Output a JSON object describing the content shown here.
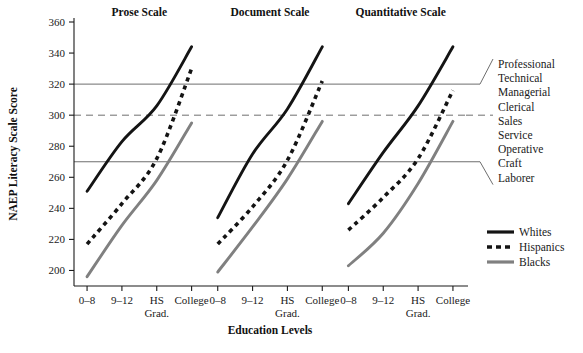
{
  "chart_data": {
    "type": "line",
    "title": "",
    "xlabel": "Education Levels",
    "ylabel": "NAEP Literacy Scale Score",
    "ylim": [
      190,
      360
    ],
    "yticks": [
      200,
      220,
      240,
      260,
      280,
      300,
      320,
      340,
      360
    ],
    "ytick_labels": [
      "200",
      "220",
      "240",
      "260",
      "280",
      "300",
      "320",
      "340",
      "360"
    ],
    "grid": true,
    "gridlines": [
      {
        "value": 320,
        "style": "solid"
      },
      {
        "value": 300,
        "style": "dashed"
      },
      {
        "value": 270,
        "style": "solid"
      }
    ],
    "categories": [
      "0–8",
      "9–12",
      "HS Grad.",
      "College"
    ],
    "category_labels": [
      {
        "line1": "0–8",
        "line2": ""
      },
      {
        "line1": "9–12",
        "line2": ""
      },
      {
        "line1": "HS",
        "line2": "Grad."
      },
      {
        "line1": "College",
        "line2": ""
      }
    ],
    "panels": [
      {
        "title": "Prose Scale",
        "series": [
          {
            "name": "Whites",
            "values": [
              251,
              283,
              306,
              344
            ]
          },
          {
            "name": "Hispanics",
            "values": [
              217,
              243,
              272,
              330
            ]
          },
          {
            "name": "Blacks",
            "values": [
              196,
              229,
              258,
              295
            ]
          }
        ]
      },
      {
        "title": "Document Scale",
        "series": [
          {
            "name": "Whites",
            "values": [
              234,
              275,
              304,
              344
            ]
          },
          {
            "name": "Hispanics",
            "values": [
              217,
              241,
              271,
              322
            ]
          },
          {
            "name": "Blacks",
            "values": [
              199,
              228,
              259,
              296
            ]
          }
        ]
      },
      {
        "title": "Quantitative Scale",
        "series": [
          {
            "name": "Whites",
            "values": [
              243,
              276,
              306,
              344
            ]
          },
          {
            "name": "Hispanics",
            "values": [
              226,
              247,
              272,
              316
            ]
          },
          {
            "name": "Blacks",
            "values": [
              203,
              224,
              256,
              296
            ]
          }
        ]
      }
    ],
    "legend": {
      "position": "bottom-right",
      "entries": [
        {
          "label": "Whites",
          "style": "solid",
          "color": "#141414"
        },
        {
          "label": "Hispanics",
          "style": "dashed",
          "color": "#141414"
        },
        {
          "label": "Blacks",
          "style": "solid",
          "color": "#808080"
        }
      ]
    },
    "annotations": {
      "name": "occupation-bands",
      "items": [
        "Professional",
        "Technical",
        "Managerial",
        "Clerical",
        "Sales",
        "Service",
        "Operative",
        "Craft",
        "Laborer"
      ]
    }
  },
  "colors": {
    "whites": "#141414",
    "hispanics": "#141414",
    "blacks": "#808080",
    "grid": "#6e6e6e",
    "axis": "#1a1a1a",
    "background": "#ffffff"
  }
}
